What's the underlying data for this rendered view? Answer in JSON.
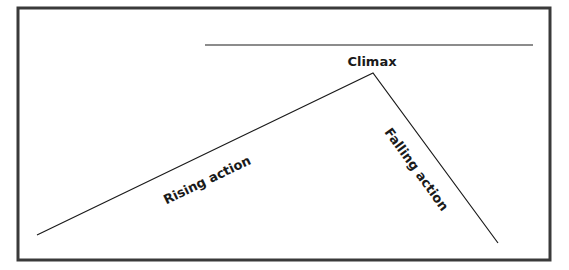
{
  "diagram": {
    "frame": {
      "x": 18,
      "y": 8,
      "width": 532,
      "height": 252,
      "stroke": "#3a3a3a",
      "stroke_width": 3
    },
    "top_line": {
      "x1": 205,
      "y1": 45,
      "x2": 533,
      "y2": 45
    },
    "plot_line": {
      "start": [
        37,
        235
      ],
      "peak": [
        373,
        73
      ],
      "end": [
        498,
        243
      ],
      "stroke": "#1a1a1a"
    },
    "labels": {
      "climax": "Climax",
      "rising_action": "Rising action",
      "falling_action": "Falling action"
    }
  }
}
